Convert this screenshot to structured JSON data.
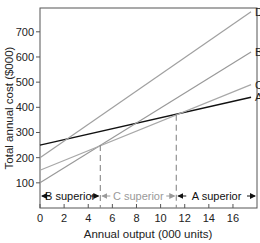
{
  "chart_data": {
    "type": "line",
    "title": "",
    "xlabel": "Annual output (000 units)",
    "ylabel": "Total annual cost ($000)",
    "xlim": [
      0,
      18
    ],
    "ylim": [
      0,
      790
    ],
    "x_ticks": [
      0,
      2,
      4,
      6,
      8,
      10,
      12,
      14,
      16
    ],
    "y_ticks": [
      100,
      200,
      300,
      400,
      500,
      600,
      700
    ],
    "grid": false,
    "legend": "inline labels at line ends",
    "series": [
      {
        "name": "A",
        "x": [
          0,
          17.5
        ],
        "values": [
          250,
          440
        ],
        "color": "#111111",
        "width": 1.4
      },
      {
        "name": "B",
        "x": [
          0,
          17.5
        ],
        "values": [
          100,
          620
        ],
        "color": "#999999",
        "width": 1.2
      },
      {
        "name": "C",
        "x": [
          0,
          17.5
        ],
        "values": [
          150,
          490
        ],
        "color": "#a8a8a8",
        "width": 1.2
      },
      {
        "name": "D",
        "x": [
          0,
          17.5
        ],
        "values": [
          200,
          780
        ],
        "color": "#a0a0a0",
        "width": 1.2
      }
    ],
    "breakpoints": [
      {
        "x": 5.0,
        "y": 250,
        "style": "dashed"
      },
      {
        "x": 11.3,
        "y": 370,
        "style": "dashed"
      }
    ],
    "regions": [
      {
        "label": "B superior",
        "from": 0,
        "to": 5.0,
        "color": "#111111"
      },
      {
        "label": "C superior",
        "from": 5.0,
        "to": 11.3,
        "color": "#9a9a9a"
      },
      {
        "label": "A superior",
        "from": 11.3,
        "to": 18,
        "color": "#111111"
      }
    ]
  },
  "labels": {
    "xlabel": "Annual output (000 units)",
    "ylabel": "Total annual cost ($000)",
    "line_A": "A",
    "line_B": "B",
    "line_C": "C",
    "line_D": "D",
    "region_B": "B superior",
    "region_C": "C superior",
    "region_A": "A superior"
  }
}
